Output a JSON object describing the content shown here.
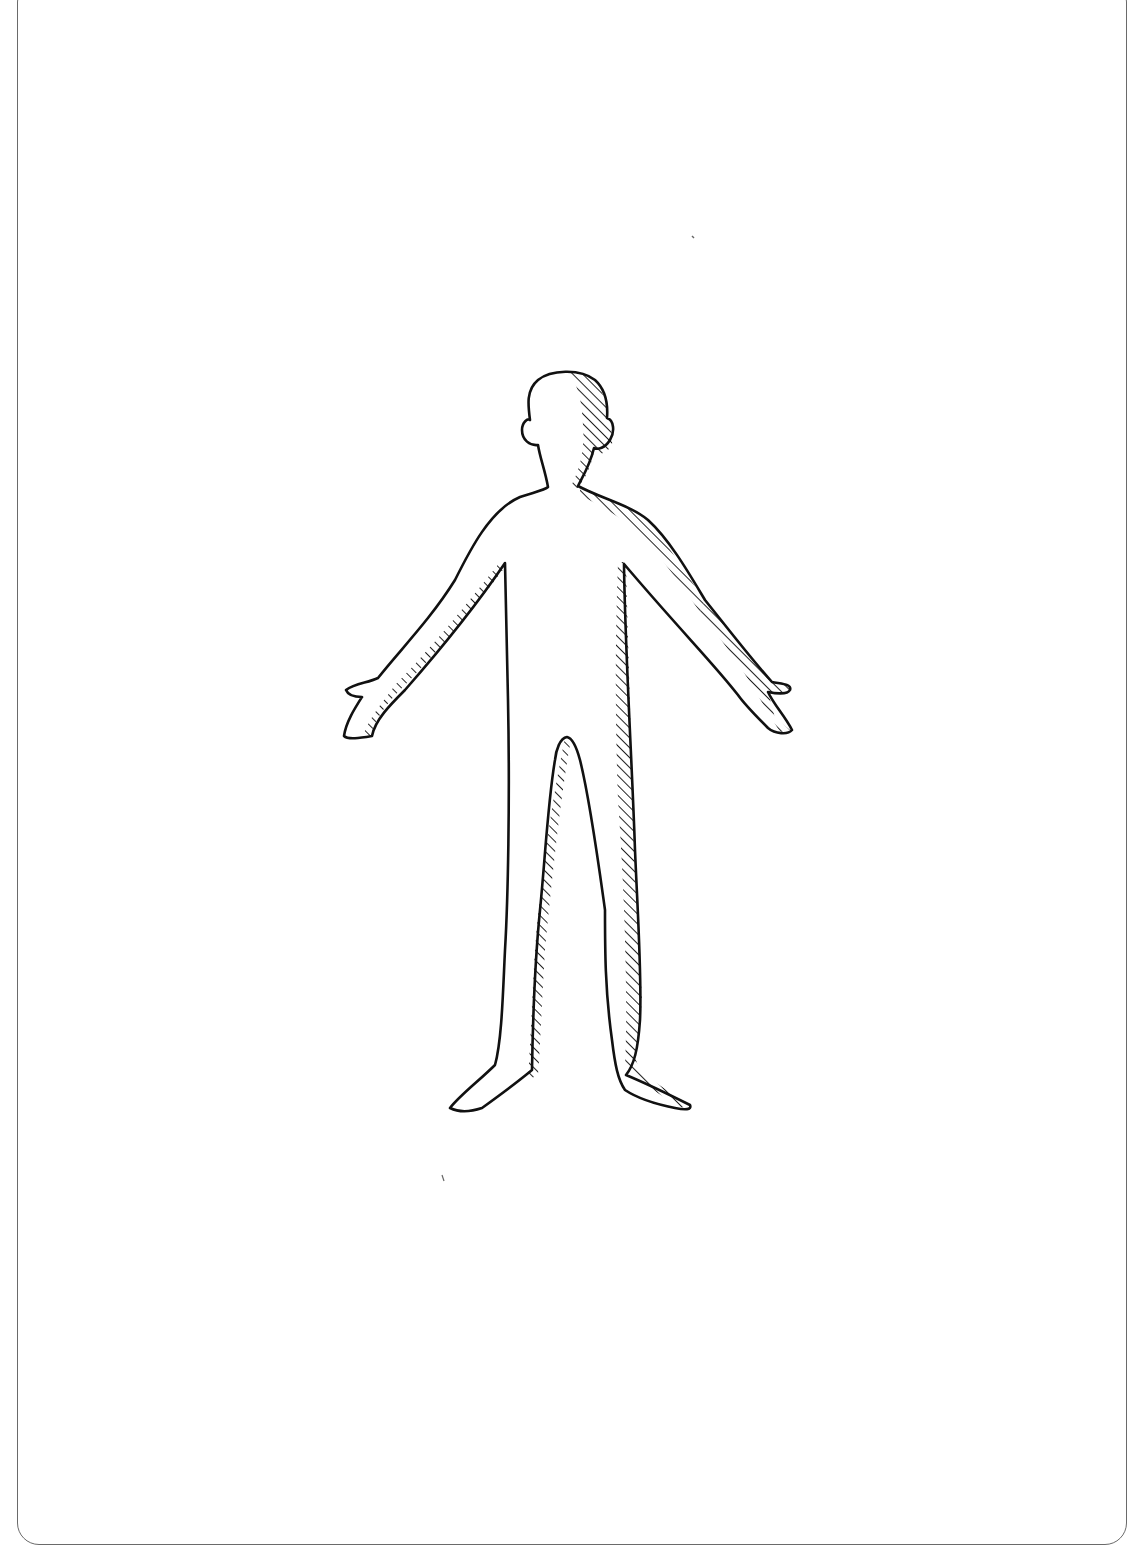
{
  "diagram": {
    "type": "body-outline",
    "view": "anterior",
    "colors": {
      "stroke": "#111111",
      "hatch": "#222222",
      "card_border": "#6a6a6a",
      "background": "#ffffff"
    },
    "parts": [
      "head",
      "ears",
      "neck",
      "torso",
      "left-arm",
      "right-arm",
      "left-hand",
      "right-hand",
      "left-leg",
      "right-leg",
      "left-foot",
      "right-foot"
    ]
  }
}
